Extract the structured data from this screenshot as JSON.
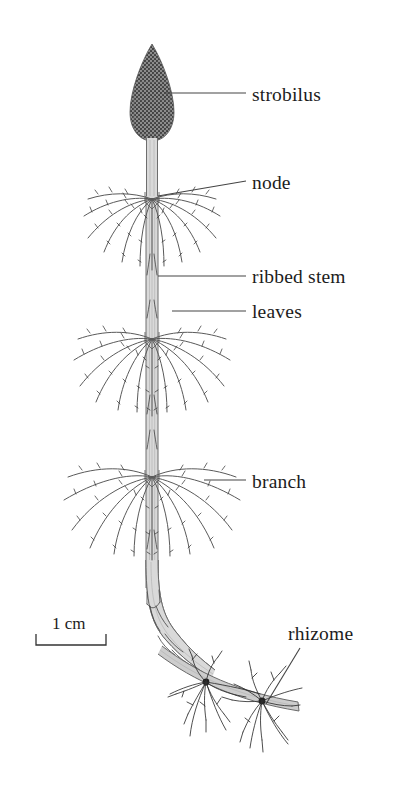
{
  "figure": {
    "background_color": "#ffffff",
    "ink_color": "#1c1c1c",
    "width": 406,
    "height": 792
  },
  "labels": [
    {
      "id": "strobilus",
      "text": "strobilus",
      "x": 252,
      "y": 101,
      "leader": "horizontal"
    },
    {
      "id": "node",
      "text": "node",
      "x": 252,
      "y": 189,
      "leader": "diagonal-up"
    },
    {
      "id": "ribbed-stem",
      "text": "ribbed stem",
      "x": 252,
      "y": 283,
      "leader": "horizontal"
    },
    {
      "id": "leaves",
      "text": "leaves",
      "x": 252,
      "y": 318,
      "leader": "horizontal"
    },
    {
      "id": "branch",
      "text": "branch",
      "x": 252,
      "y": 488,
      "leader": "horizontal"
    },
    {
      "id": "rhizome",
      "text": "rhizome",
      "x": 288,
      "y": 640,
      "leader": "diagonal-down"
    }
  ],
  "scale_bar": {
    "label": "1 cm",
    "x": 36,
    "y": 644,
    "length_px": 70,
    "text_x": 52,
    "text_y": 628
  },
  "parts": {
    "strobilus": {
      "name": "strobilus",
      "cx": 152,
      "top": 44,
      "bottom": 140,
      "half_width": 22,
      "stipple_color": "#4a4a4a"
    },
    "stem": {
      "name": "ribbed stem",
      "x": 152,
      "top": 138,
      "bottom": 588,
      "width": 11,
      "rib_count": 3
    },
    "whorls": [
      {
        "id": "whorl-1",
        "cy": 200,
        "spread": 74,
        "branch_count": 13
      },
      {
        "id": "whorl-2",
        "cy": 340,
        "spread": 82,
        "branch_count": 13
      },
      {
        "id": "whorl-3",
        "cy": 478,
        "spread": 92,
        "branch_count": 13
      }
    ],
    "rhizome": {
      "name": "rhizome",
      "start_x": 160,
      "start_y": 600,
      "end_x": 300,
      "end_y": 706,
      "thickness": 9
    },
    "root_clusters": [
      {
        "id": "root-cluster-1",
        "cx": 206,
        "cy": 683,
        "root_count": 11
      },
      {
        "id": "root-cluster-2",
        "cx": 262,
        "cy": 704,
        "root_count": 11
      }
    ]
  }
}
